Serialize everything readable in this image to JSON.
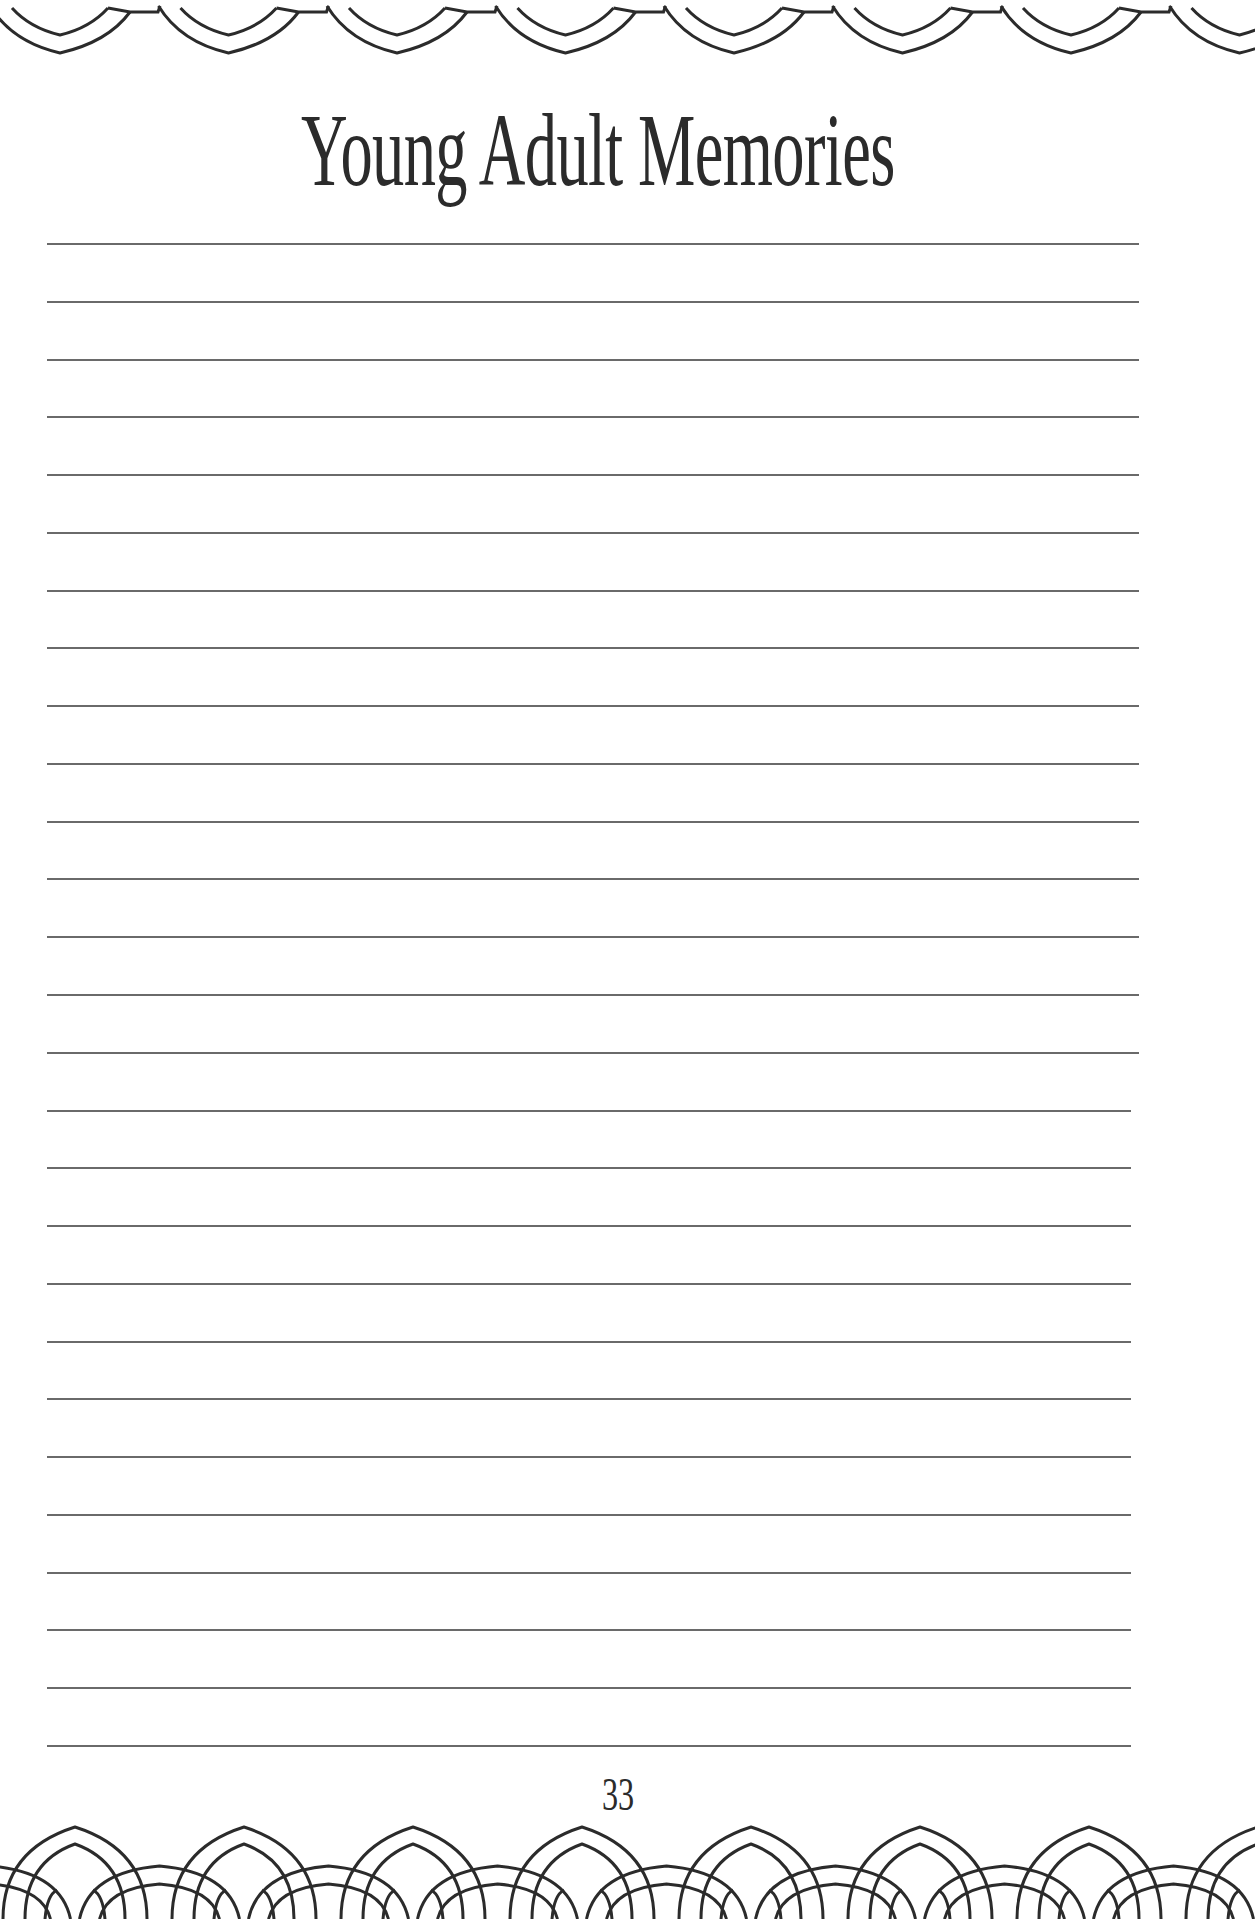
{
  "page": {
    "title": "Young Adult Memories",
    "page_number": "33",
    "colors": {
      "ink": "#2b2b2b",
      "rule": "#6a6a6a",
      "paper": "#ffffff"
    }
  },
  "writing_lines": {
    "count": 27,
    "left": 47,
    "first_top": 243,
    "spacing": 57.77,
    "right_ends": [
      1139,
      1139,
      1139,
      1139,
      1139,
      1139,
      1139,
      1139,
      1139,
      1139,
      1139,
      1139,
      1139,
      1139,
      1139,
      1131,
      1131,
      1131,
      1131,
      1131,
      1131,
      1131,
      1131,
      1131,
      1131,
      1131,
      1131
    ]
  },
  "decorations": {
    "top_border": {
      "icon": "pointed-arch-scallop-border-icon",
      "period": 168.5,
      "first_center": 60
    },
    "bottom_border": {
      "icon": "interlocking-arch-border-icon",
      "period": 169,
      "first_center": 75
    }
  }
}
